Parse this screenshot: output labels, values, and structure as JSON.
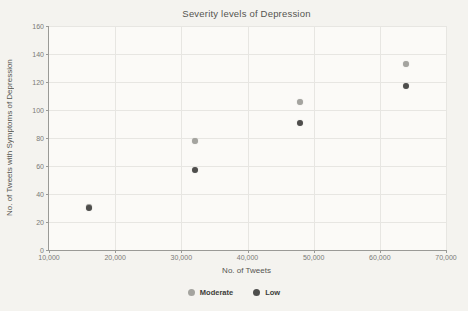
{
  "chart_data": {
    "type": "scatter",
    "title": "Severity levels of Depression",
    "xlabel": "No. of Tweets",
    "ylabel": "No. of Tweets with Symptoms of Depression",
    "xlim": [
      10000,
      70000
    ],
    "ylim": [
      0,
      160
    ],
    "x_ticks": [
      10000,
      20000,
      30000,
      40000,
      50000,
      60000,
      70000
    ],
    "x_tick_labels": [
      "10,000",
      "20,000",
      "30,000",
      "40,000",
      "50,000",
      "60,000",
      "70,000"
    ],
    "y_ticks": [
      0,
      20,
      40,
      60,
      80,
      100,
      120,
      140,
      160
    ],
    "y_tick_labels": [
      "0",
      "20",
      "40",
      "60",
      "80",
      "100",
      "120",
      "140",
      "160"
    ],
    "grid": true,
    "legend_position": "bottom-center",
    "series": [
      {
        "name": "Moderate",
        "color": "#a4a49f",
        "points": [
          [
            16000,
            31
          ],
          [
            32000,
            78
          ],
          [
            48000,
            106
          ],
          [
            64000,
            133
          ]
        ]
      },
      {
        "name": "Low",
        "color": "#4e4e4c",
        "points": [
          [
            16000,
            30
          ],
          [
            32000,
            57
          ],
          [
            48000,
            91
          ],
          [
            64000,
            117
          ]
        ]
      }
    ]
  }
}
